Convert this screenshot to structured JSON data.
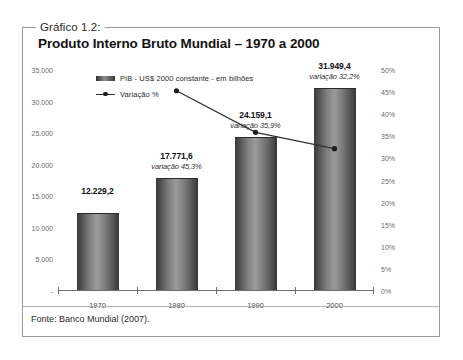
{
  "figure": {
    "caption_tag": "Gráfico 1.2:",
    "title": "Produto Interno Bruto Mundial – 1970 a 2000",
    "source": "Fonte: Banco Mundial (2007)."
  },
  "chart_data": {
    "type": "bar",
    "title": "Produto Interno Bruto Mundial – 1970 a 2000",
    "xlabel": "",
    "ylabel": "",
    "grid": false,
    "legend_position": "top",
    "categories": [
      "1970",
      "1980",
      "1990",
      "2000"
    ],
    "series": [
      {
        "name": "PIB - US$ 2000 constante - em bilhões",
        "type": "bar",
        "values": [
          12229.2,
          17771.6,
          24159.1,
          31949.4
        ],
        "value_labels": [
          "12.229,2",
          "17.771,6",
          "24.159,1",
          "31.949,4"
        ],
        "axis": "left",
        "color": "#7e7e7e"
      },
      {
        "name": "Variação %",
        "type": "line",
        "x": [
          "1980",
          "1990",
          "2000"
        ],
        "values": [
          45.3,
          35.9,
          32.2
        ],
        "value_labels": [
          "variação 45,3%",
          "variação 35,9%",
          "variação 32,2%"
        ],
        "axis": "right",
        "color": "#333333"
      }
    ],
    "left_axis": {
      "ticks": [
        "35.000",
        "30.000",
        "25.000",
        "20.000",
        "15.000",
        "10.000",
        "5.000",
        "-"
      ],
      "tick_values": [
        35000,
        30000,
        25000,
        20000,
        15000,
        10000,
        5000,
        0
      ],
      "ylim": [
        0,
        35000
      ]
    },
    "right_axis": {
      "ticks": [
        "50%",
        "45%",
        "40%",
        "35%",
        "30%",
        "25%",
        "20%",
        "15%",
        "10%",
        "5%",
        "0%"
      ],
      "tick_values": [
        50,
        45,
        40,
        35,
        30,
        25,
        20,
        15,
        10,
        5,
        0
      ],
      "ylim": [
        0,
        50
      ]
    },
    "legend": [
      {
        "label": "PIB - US$ 2000 constante - em bilhões",
        "marker": "bar-swatch"
      },
      {
        "label": "Variação %",
        "marker": "line-marker"
      }
    ]
  }
}
